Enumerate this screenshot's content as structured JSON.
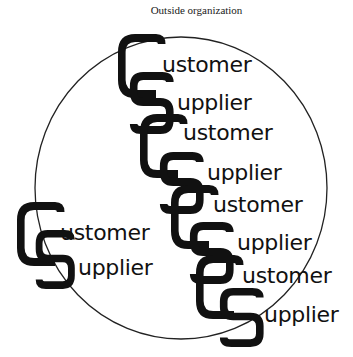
{
  "diagram": {
    "title": "Outside organization",
    "boundary": {
      "shape": "circle",
      "label": "organization boundary"
    },
    "pairs": [
      {
        "id": "outside",
        "customer": "ustomer",
        "supplier": "upplier",
        "customer_initial": "C",
        "supplier_initial": "S",
        "location": "outside circle"
      },
      {
        "id": "inside-1",
        "customer": "ustomer",
        "supplier": "upplier",
        "customer_initial": "C",
        "supplier_initial": "S",
        "location": "top (crossing boundary)"
      },
      {
        "id": "inside-2",
        "customer": "ustomer",
        "supplier": "upplier",
        "customer_initial": "C",
        "supplier_initial": "S",
        "location": "inside"
      },
      {
        "id": "inside-3",
        "customer": "ustomer",
        "supplier": "upplier",
        "customer_initial": "C",
        "supplier_initial": "S",
        "location": "inside"
      },
      {
        "id": "inside-4",
        "customer": "ustomer",
        "supplier": "upplier",
        "customer_initial": "C",
        "supplier_initial": "S",
        "location": "bottom (crossing boundary)"
      }
    ],
    "colors": {
      "ink": "#111111",
      "background": "#ffffff"
    }
  }
}
